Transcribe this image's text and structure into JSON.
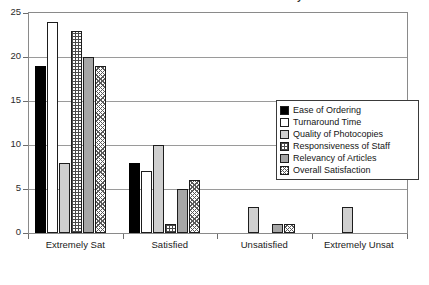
{
  "chart_data": {
    "type": "bar",
    "title": "Satisfaction with Document Delivery",
    "xlabel": "",
    "ylabel": "",
    "ylim": [
      0,
      25
    ],
    "yticks": [
      0,
      5,
      10,
      15,
      20,
      25
    ],
    "grid": true,
    "legend_position": "inside-right",
    "categories": [
      "Extremely Sat",
      "Satisfied",
      "Unsatisfied",
      "Extremely Unsat"
    ],
    "series": [
      {
        "name": "Ease of Ordering",
        "values": [
          19,
          8,
          0,
          0
        ],
        "swatch": "sw-solidblack"
      },
      {
        "name": "Turnaround Time",
        "values": [
          24,
          7,
          0,
          0
        ],
        "swatch": "sw-white"
      },
      {
        "name": "Quality of Photocopies",
        "values": [
          8,
          10,
          3,
          3
        ],
        "swatch": "sw-lightgray"
      },
      {
        "name": "Responsiveness of Staff",
        "values": [
          23,
          1,
          0,
          0
        ],
        "swatch": "sw-grid"
      },
      {
        "name": "Relevancy of Articles",
        "values": [
          20,
          5,
          1,
          0
        ],
        "swatch": "sw-medgray"
      },
      {
        "name": "Overall Satisfaction",
        "values": [
          19,
          6,
          1,
          0
        ],
        "swatch": "sw-crosshatch"
      }
    ]
  },
  "colors": {
    "axis": "#8a8a8a",
    "gridline": "#9a9a9a",
    "text": "#1a1a1a",
    "bar_outline": "#1d1d1d",
    "series_1": "#000000",
    "series_2": "#ffffff",
    "series_3": "#cfcfcf",
    "series_4": "#4a4a4a",
    "series_5": "#a6a6a6",
    "series_6": "#5a5a5a"
  }
}
